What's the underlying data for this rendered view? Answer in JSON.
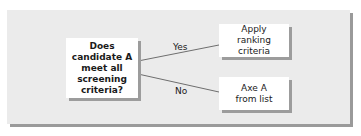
{
  "diagram": {
    "type": "decision-flowchart",
    "decision": {
      "text": "Does candidate A meet all screening criteria?"
    },
    "branches": [
      {
        "label": "Yes",
        "outcome": "Apply ranking criteria"
      },
      {
        "label": "No",
        "outcome": "Axe A from list"
      }
    ],
    "colors": {
      "panel": "#ebebeb",
      "box": "#ffffff",
      "shadow": "#9c9c9c",
      "line": "#6e6e6e"
    }
  }
}
